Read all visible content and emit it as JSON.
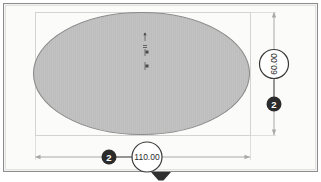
{
  "drawing": {
    "type": "cad-sketch",
    "shape": "ellipse",
    "background_color": "#ffffff",
    "frame": {
      "fill_color": "#f2f2f0",
      "border_color": "#8d8d8d"
    },
    "ellipse": {
      "fill_color": "#bcbcbc",
      "stroke_color": "#8a8a8a",
      "center_x": 141.5,
      "center_y": 73.5,
      "radius_x": 108,
      "radius_y": 61
    },
    "extension_box": {
      "stroke_color": "#c9c9c9"
    },
    "center_marks": [
      {
        "name": "mark-arrow-up",
        "x": 145,
        "y": 36
      },
      {
        "name": "mark-tick-a",
        "x": 145,
        "y": 45
      },
      {
        "name": "mark-tick-b",
        "x": 145,
        "y": 52
      },
      {
        "name": "mark-tick-c",
        "x": 145,
        "y": 66
      }
    ],
    "dimensions": [
      {
        "id": "vertical-height",
        "orientation": "vertical",
        "value": "60.00",
        "badge": "2",
        "badge_bg_color": "#2b2b2b",
        "badge_text_color": "#ffffff",
        "bubble_stroke_color": "#3a3a3a",
        "bubble_fill_color": "#ffffff",
        "text_color": "#2b2b2b",
        "line_color": "#a9a9a9",
        "line_x": 274,
        "line_y_top": 12,
        "line_y_bottom": 135,
        "bubble_cx": 274,
        "bubble_cy": 64,
        "bubble_r": 14.5,
        "badge_cx": 274,
        "badge_cy": 104,
        "badge_r": 7.5
      },
      {
        "id": "horizontal-width",
        "orientation": "horizontal",
        "value": "110.00",
        "badge": "2",
        "badge_bg_color": "#2b2b2b",
        "badge_text_color": "#ffffff",
        "bubble_stroke_color": "#3a3a3a",
        "bubble_fill_color": "#ffffff",
        "text_color": "#2b2b2b",
        "line_color": "#a9a9a9",
        "line_y": 157,
        "line_x_left": 35,
        "line_x_right": 250,
        "bubble_cx": 147,
        "bubble_cy": 157,
        "bubble_r": 15,
        "badge_cx": 109,
        "badge_cy": 157,
        "badge_r": 7.5
      }
    ],
    "bottom_marker": {
      "name": "drag-handle-triangle",
      "fill_color": "#2f2f2f",
      "cx": 161,
      "cy": 176
    }
  }
}
